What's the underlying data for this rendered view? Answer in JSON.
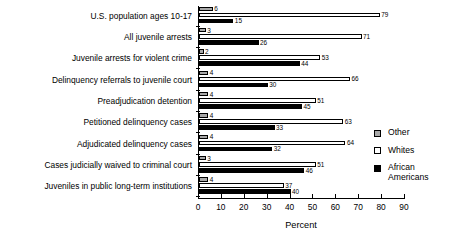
{
  "chart_data": {
    "type": "bar",
    "orientation": "horizontal",
    "title": "",
    "xlabel": "Percent",
    "ylabel": "",
    "xlim": [
      0,
      90
    ],
    "xticks": [
      0,
      10,
      20,
      30,
      40,
      50,
      60,
      70,
      80,
      90
    ],
    "grid": false,
    "legend_position": "right",
    "categories": [
      "U.S. population ages 10-17",
      "All juvenile arrests",
      "Juvenile arrests for violent crime",
      "Delinquency referrals to juvenile court",
      "Preadjudication detention",
      "Petitioned delinquency cases",
      "Adjudicated delinquency cases",
      "Cases judicially waived to criminal court",
      "Juveniles in public long-term institutions"
    ],
    "series": [
      {
        "name": "Other",
        "color": "#a8a8a8",
        "values": [
          6,
          3,
          2,
          4,
          4,
          4,
          4,
          3,
          4
        ]
      },
      {
        "name": "Whites",
        "color": "#ffffff",
        "values": [
          79,
          71,
          53,
          66,
          51,
          63,
          64,
          51,
          37
        ]
      },
      {
        "name": "African Americans",
        "color": "#000000",
        "values": [
          15,
          26,
          44,
          30,
          45,
          33,
          32,
          46,
          40
        ]
      }
    ]
  },
  "legend": {
    "entries": [
      {
        "label": "Other",
        "swatch": "other"
      },
      {
        "label": "Whites",
        "swatch": "white"
      },
      {
        "label": "African\nAmericans",
        "swatch": "black"
      }
    ]
  },
  "axis": {
    "x_title": "Percent",
    "tick_labels": [
      "0",
      "10",
      "20",
      "30",
      "40",
      "50",
      "60",
      "70",
      "80",
      "90"
    ]
  }
}
